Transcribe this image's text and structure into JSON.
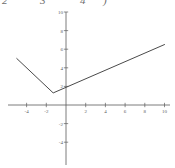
{
  "page": {
    "width": 175,
    "height": 168,
    "background": "#ffffff",
    "ink_color": "#4a4a4a",
    "label_color": "#5c5c5c"
  },
  "top_labels": {
    "note": "bottom halves of italic characters cropped at the top edge of the scan",
    "items": [
      {
        "text": "2",
        "x": 2
      },
      {
        "text": "3",
        "x": 40
      },
      {
        "text": "4",
        "x": 80
      },
      {
        "text": ")",
        "x": 103
      }
    ]
  },
  "chart_data": {
    "type": "line",
    "title": "",
    "subtitle": "",
    "xlabel": "",
    "ylabel": "",
    "xlim": [
      -6,
      10.5
    ],
    "ylim": [
      -5.5,
      10.5
    ],
    "grid": false,
    "legend": null,
    "xticks": [
      -4,
      -2,
      2,
      4,
      6,
      8,
      10
    ],
    "xtick_labels": [
      "-4",
      "-2",
      "2",
      "4",
      "6",
      "8",
      "10"
    ],
    "yticks": [
      10,
      8,
      6,
      4,
      2,
      -2,
      -4
    ],
    "ytick_labels": [
      "10",
      "8",
      "6",
      "4",
      "2",
      "-2",
      "-4"
    ],
    "series": [
      {
        "name": "v-shaped absolute value graph",
        "x": [
          -5.0,
          -1.3,
          10.0
        ],
        "y": [
          5.0,
          1.3,
          6.5
        ],
        "color": "#4a4a4a",
        "linewidth": 1,
        "vertex": [
          -1.3,
          1.3
        ],
        "y_intercept": 1.8
      }
    ]
  }
}
